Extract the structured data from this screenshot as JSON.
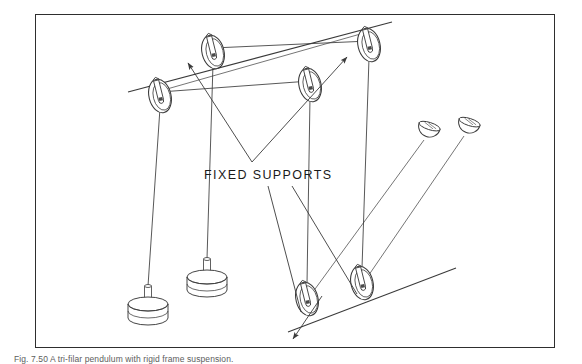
{
  "figure": {
    "label": "FIXED SUPPORTS",
    "caption": "Fig. 7.50  A tri-filar pendulum with rigid frame suspension.",
    "frame": {
      "x": 35,
      "y": 14,
      "width": 520,
      "height": 334,
      "border_color": "#2e2e2e",
      "background": "#ffffff"
    },
    "line_color": "#3a3a3a",
    "ink_color": "#1a1a1a",
    "background_color": "#ffffff"
  },
  "diagram": {
    "type": "line-drawing",
    "support_rails": [
      {
        "name": "upper-rail",
        "x1": 128,
        "y1": 92,
        "x2": 392,
        "y2": 22
      },
      {
        "name": "lower-rail",
        "x1": 288,
        "y1": 330,
        "x2": 452,
        "y2": 268
      }
    ],
    "pulleys": [
      {
        "name": "pulley-upper-left",
        "cx": 160,
        "cy": 96,
        "rx": 11,
        "ry": 17,
        "rot": -14
      },
      {
        "name": "pulley-upper-mid",
        "cx": 213,
        "cy": 52,
        "rx": 11,
        "ry": 17,
        "rot": -14
      },
      {
        "name": "pulley-upper-right",
        "cx": 310,
        "cy": 85,
        "rx": 11,
        "ry": 17,
        "rot": -14
      },
      {
        "name": "pulley-top-right",
        "cx": 369,
        "cy": 45,
        "rx": 12,
        "ry": 18,
        "rot": -14
      },
      {
        "name": "pulley-lower-left",
        "cx": 307,
        "cy": 299,
        "rx": 11,
        "ry": 17,
        "rot": -14
      },
      {
        "name": "pulley-lower-right",
        "cx": 362,
        "cy": 283,
        "rx": 11,
        "ry": 17,
        "rot": -14
      }
    ],
    "weights": [
      {
        "name": "weight-stack-left",
        "cx": 148,
        "cy": 318,
        "rx": 20,
        "ry": 7,
        "discs": 3,
        "rod_top": 283
      },
      {
        "name": "weight-stack-right",
        "cx": 207,
        "cy": 290,
        "rx": 20,
        "ry": 7,
        "discs": 3,
        "rod_top": 257
      }
    ],
    "pans": [
      {
        "name": "weight-pan-left",
        "cx": 429,
        "cy": 128,
        "r": 11,
        "stem_x": 405,
        "stem_y": 175
      },
      {
        "name": "weight-pan-right",
        "cx": 469,
        "cy": 124,
        "r": 11,
        "stem_x": 444,
        "stem_y": 172
      }
    ],
    "leader_lines": [
      {
        "name": "leader-to-upper-left",
        "from_x": 252,
        "from_y": 160,
        "to_x": 187,
        "to_y": 62
      },
      {
        "name": "leader-to-upper-right",
        "from_x": 252,
        "from_y": 160,
        "to_x": 348,
        "to_y": 57
      }
    ],
    "lower_leaders": [
      {
        "name": "leader-lower-a",
        "from_x": 268,
        "from_y": 186,
        "to_x": 300,
        "to_y": 313
      },
      {
        "name": "leader-lower-b",
        "from_x": 292,
        "from_y": 186,
        "to_x": 356,
        "to_y": 296
      }
    ],
    "arrow_down_left": {
      "name": "arrow-down-left",
      "from_x": 322,
      "from_y": 298,
      "to_x": 292,
      "to_y": 340
    }
  }
}
